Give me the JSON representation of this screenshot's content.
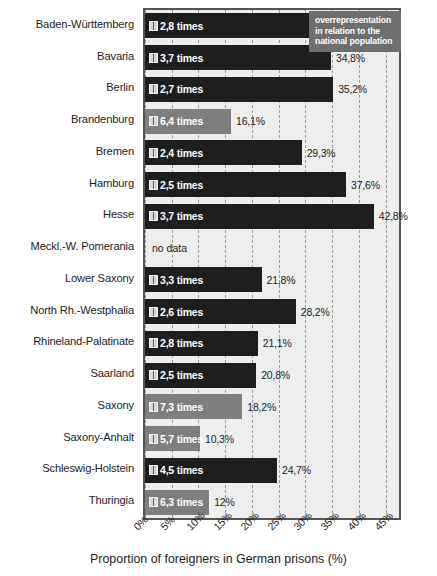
{
  "chart_data": {
    "type": "bar",
    "orientation": "horizontal",
    "title": "",
    "xlabel": "Proportion of foreigners in German prisons (%)",
    "ylabel": "",
    "xlim": [
      0,
      47.5
    ],
    "xticks": [
      "0%",
      "5%",
      "10%",
      "15%",
      "20%",
      "25%",
      "30%",
      "35%",
      "40%",
      "45%"
    ],
    "xtick_values": [
      0,
      5,
      10,
      15,
      20,
      25,
      30,
      35,
      40,
      45
    ],
    "grid": "vertical-dashed",
    "legend_position": "inside-right",
    "categories": [
      "Baden-Württemberg",
      "Bavaria",
      "Berlin",
      "Brandenburg",
      "Bremen",
      "Hamburg",
      "Hesse",
      "Meckl.-W. Pomerania",
      "Lower Saxony",
      "North Rh.-Westphalia",
      "Rhineland-Palatinate",
      "Saarland",
      "Saxony",
      "Saxony-Anhalt",
      "Schleswig-Holstein",
      "Thuringia"
    ],
    "values": [
      33.9,
      34.8,
      35.2,
      16.1,
      29.3,
      37.6,
      42.8,
      null,
      21.8,
      28.2,
      21.1,
      20.8,
      18.2,
      10.3,
      24.7,
      12.0
    ],
    "value_labels": [
      "33,9%",
      "34,8%",
      "35,2%",
      "16,1%",
      "29,3%",
      "37,6%",
      "42,8%",
      "no data",
      "21,8%",
      "28,2%",
      "21,1%",
      "20,8%",
      "18,2%",
      "10,3%",
      "24,7%",
      "12%"
    ],
    "overrepresentation_labels": [
      "2,8 times",
      "3,7 times",
      "2,7 times",
      "6,4 times",
      "2,4 times",
      "2,5 times",
      "3,7 times",
      "",
      "3,3 times",
      "2,6 times",
      "2,8 times",
      "2,5 times",
      "7,3 times",
      "5,7 times",
      "4,5 times",
      "6,3 times"
    ],
    "overrepresentation_values": [
      2.8,
      3.7,
      2.7,
      6.4,
      2.4,
      2.5,
      3.7,
      null,
      3.3,
      2.6,
      2.8,
      2.5,
      7.3,
      5.7,
      4.5,
      6.3
    ],
    "bar_shades": [
      "dark",
      "dark",
      "dark",
      "light",
      "dark",
      "dark",
      "dark",
      "none",
      "dark",
      "dark",
      "dark",
      "dark",
      "light",
      "light",
      "dark",
      "light"
    ],
    "colors": {
      "bar_dark": "#1e1e1e",
      "bar_light": "#7e7e7e",
      "plot_background": "#eeeeee",
      "plot_border": "#555555",
      "gridline": "#9a9a9a",
      "legend_background": "#6e6e6e",
      "legend_text": "#ffffff",
      "text": "#1d1d1d"
    }
  },
  "legend": {
    "lines": [
      "overrepresentation",
      "in relation to the",
      "national population"
    ]
  },
  "icons": {
    "bar_marker": "book-icon"
  },
  "footer": {
    "source": ""
  }
}
